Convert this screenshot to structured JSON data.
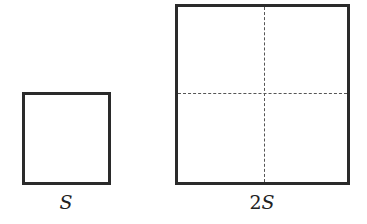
{
  "figure": {
    "small_square": {
      "label": "S"
    },
    "large_square": {
      "label_coefficient": "2",
      "label_variable": "S",
      "divisions": "2x2 dashed grid"
    }
  }
}
